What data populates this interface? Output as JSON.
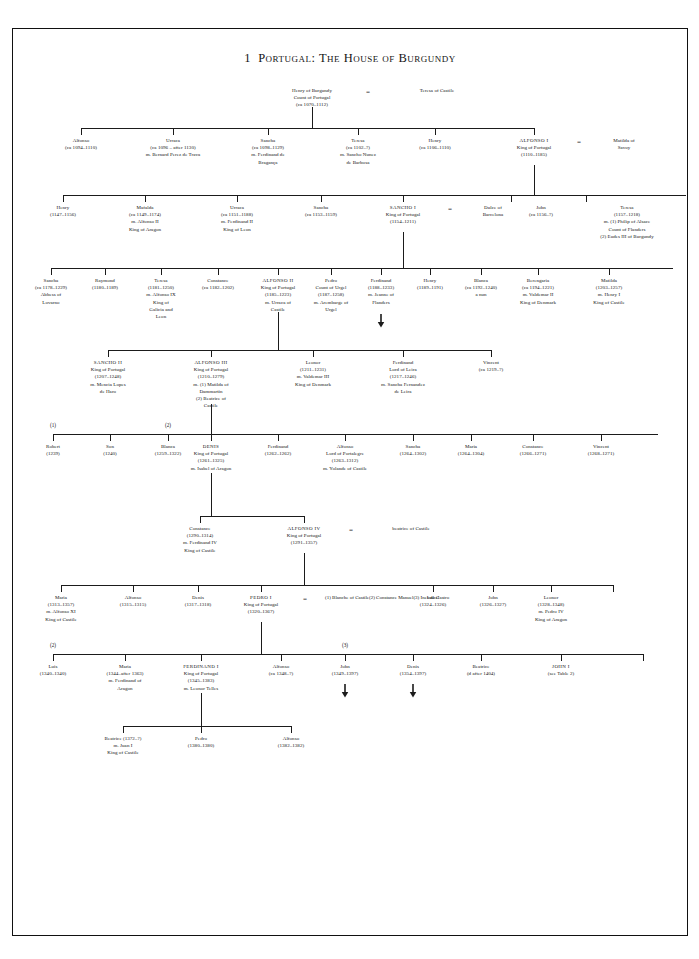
{
  "page": {
    "title_number": "1",
    "title_text": "Portugal: The House of Burgundy",
    "chart_type": "genealogical-tree"
  },
  "chart_data": {
    "type": "diagram",
    "notation": {
      "marriage_symbol": "=",
      "marriage_abbrev": "m.",
      "circa_abbrev": "ca",
      "continues_below_symbol": "down-arrow",
      "spouse_order_markers": [
        "(1)",
        "(2)",
        "(3)"
      ]
    },
    "generations": [
      {
        "index": 0,
        "people": [
          {
            "name": "Henry of Burgundy",
            "lines": [
              "Count of Portugal",
              "(ca 1070–1112)"
            ]
          },
          {
            "name": "Teresa of Castile",
            "lines": [],
            "role": "spouse"
          }
        ]
      },
      {
        "index": 1,
        "people": [
          {
            "name": "Alfonso",
            "lines": [
              "(ca 1094–1110)"
            ]
          },
          {
            "name": "Urraca",
            "lines": [
              "(ca 1096 – after 1130)",
              "m. Bernard Perez de Trava"
            ]
          },
          {
            "name": "Sancha",
            "lines": [
              "(ca 1098–1129)",
              "m. Ferdinand de",
              "Bragança"
            ]
          },
          {
            "name": "Teresa",
            "lines": [
              "(ca 1102–?)",
              "m. Sancho Nunez",
              "de Barbosa"
            ]
          },
          {
            "name": "Henry",
            "lines": [
              "(ca 1106–1110)"
            ]
          },
          {
            "name": "ALFONSO I",
            "king": true,
            "lines": [
              "King of Portugal",
              "(1110–1185)"
            ]
          },
          {
            "name": "Matilda of",
            "lines": [
              "Savoy"
            ],
            "role": "spouse"
          }
        ]
      },
      {
        "index": 2,
        "people": [
          {
            "name": "Henry",
            "lines": [
              "(1147–1156)"
            ]
          },
          {
            "name": "Mafalda",
            "lines": [
              "(ca 1149–1174)",
              "m. Alfonso II",
              "King of Aragon"
            ]
          },
          {
            "name": "Urraca",
            "lines": [
              "(ca 1151–1188)",
              "m. Ferdinand II",
              "King of Leon"
            ]
          },
          {
            "name": "Sancha",
            "lines": [
              "(ca 1153–1159)"
            ]
          },
          {
            "name": "SANCHO I",
            "king": true,
            "lines": [
              "King of Portugal",
              "(1154–1211)"
            ]
          },
          {
            "name": "Dulce of",
            "lines": [
              "Barcelona"
            ],
            "role": "spouse"
          },
          {
            "name": "John",
            "lines": [
              "(ca 1156–?)"
            ]
          },
          {
            "name": "Teresa",
            "lines": [
              "(1157–1218)",
              "m. (1) Philip of Alsace",
              "Count of Flanders",
              "(2) Eudes III of Burgundy"
            ]
          }
        ]
      },
      {
        "index": 3,
        "people": [
          {
            "name": "Sancha",
            "lines": [
              "(ca 1178–1229)",
              "Abbess of",
              "Lovarno"
            ]
          },
          {
            "name": "Raymond",
            "lines": [
              "(1180–1189)"
            ]
          },
          {
            "name": "Teresa",
            "lines": [
              "(1181–1250)",
              "m. Alfonso IX",
              "King of",
              "Galicia and",
              "Leon"
            ]
          },
          {
            "name": "Constance",
            "lines": [
              "(ca 1182–1202)"
            ]
          },
          {
            "name": "ALFONSO II",
            "king": true,
            "lines": [
              "King of Portugal",
              "(1185–1223)",
              "m. Urraca of",
              "Castile"
            ]
          },
          {
            "name": "Pedro",
            "lines": [
              "Count of Urgel",
              "(1187–1258)",
              "m. Arembarge of",
              "Urgel"
            ]
          },
          {
            "name": "Ferdinand",
            "lines": [
              "(1188–1233)",
              "m. Jeanne of",
              "Flanders"
            ],
            "arrow": true
          },
          {
            "name": "Henry",
            "lines": [
              "(1189–1191)"
            ]
          },
          {
            "name": "Blanca",
            "lines": [
              "(ca 1192–1240)",
              "a nun"
            ]
          },
          {
            "name": "Berengaria",
            "lines": [
              "(ca 1194–1221)",
              "m. Valdemar II",
              "King of Denmark"
            ]
          },
          {
            "name": "Matilda",
            "lines": [
              "(1203–1257)",
              "m. Henry I",
              "King of Castile"
            ]
          }
        ]
      },
      {
        "index": 4,
        "people": [
          {
            "name": "SANCHO II",
            "king": true,
            "lines": [
              "King of Portugal",
              "(1207–1248)",
              "m. Mencia Lopes",
              "de Haro"
            ]
          },
          {
            "name": "ALFONSO III",
            "king": true,
            "lines": [
              "King of Portugal",
              "(1210–1279)",
              "m. (1) Matilda of",
              "Dammartin",
              "(2) Beatrice of",
              "Castile"
            ]
          },
          {
            "name": "Leonor",
            "lines": [
              "(1211–1231)",
              "m. Valdemar III",
              "King of Denmark"
            ]
          },
          {
            "name": "Ferdinand",
            "lines": [
              "Lord of Leira",
              "(1217–1246)",
              "m. Sancha Fernandez",
              "de Leira"
            ]
          },
          {
            "name": "Vincent",
            "lines": [
              "(ca 1219–?)"
            ]
          }
        ]
      },
      {
        "index": 5,
        "marker_labels": [
          "(1)",
          "(2)"
        ],
        "people": [
          {
            "name": "Robert",
            "lines": [
              "(1239)"
            ],
            "marker": "(1)"
          },
          {
            "name": "Son",
            "lines": [
              "(1240)"
            ]
          },
          {
            "name": "Blanca",
            "lines": [
              "(1259–1322)"
            ],
            "marker": "(2)"
          },
          {
            "name": "DENIS",
            "king": true,
            "lines": [
              "King of Portugal",
              "(1261–1325)",
              "m. Isabel of Aragon"
            ]
          },
          {
            "name": "Ferdinand",
            "lines": [
              "(1262–1262)"
            ]
          },
          {
            "name": "Alfonso",
            "lines": [
              "Lord of Portalegre",
              "(1263–1312)",
              "m. Yolande of Castile"
            ]
          },
          {
            "name": "Sancha",
            "lines": [
              "(1264–1302)"
            ]
          },
          {
            "name": "Maria",
            "lines": [
              "(1264–1304)"
            ]
          },
          {
            "name": "Constance",
            "lines": [
              "(1266–1271)"
            ]
          },
          {
            "name": "Vincent",
            "lines": [
              "(1268–1271)"
            ]
          }
        ]
      },
      {
        "index": 6,
        "people": [
          {
            "name": "Constance",
            "lines": [
              "(1290–1314)",
              "m. Ferdinand IV",
              "King of Castile"
            ]
          },
          {
            "name": "ALFONSO IV",
            "king": true,
            "lines": [
              "King of Portugal",
              "(1291–1357)"
            ]
          },
          {
            "name": "beatrice of Castile",
            "lines": [],
            "role": "spouse"
          }
        ]
      },
      {
        "index": 7,
        "people": [
          {
            "name": "Maria",
            "lines": [
              "(1313–1357)",
              "m. Alfonso XI",
              "King of Castile"
            ]
          },
          {
            "name": "Alfonso",
            "lines": [
              "(1315–1315)"
            ]
          },
          {
            "name": "Denis",
            "lines": [
              "(1317–1318)"
            ]
          },
          {
            "name": "PEDRO I",
            "king": true,
            "lines": [
              "King of Portugal",
              "(1320–1367)"
            ]
          },
          {
            "name": "spouses",
            "role": "spouse",
            "lines": [
              "(1) Blanche of Castile",
              "(2) Constance Manuel",
              "(3) Ines de Castro"
            ]
          },
          {
            "name": "Isabel",
            "lines": [
              "(1324–1326)"
            ]
          },
          {
            "name": "John",
            "lines": [
              "(1326–1327)"
            ]
          },
          {
            "name": "Leonor",
            "lines": [
              "(1328–1348)",
              "m. Pedro IV",
              "King of Aragon"
            ]
          }
        ]
      },
      {
        "index": 8,
        "marker_labels": [
          "(2)",
          "(3)"
        ],
        "people": [
          {
            "name": "Luis",
            "lines": [
              "(1340–1340)"
            ],
            "marker": "(2)"
          },
          {
            "name": "Maria",
            "lines": [
              "(1344–after 1363)",
              "m. Ferdinand of",
              "Aragon"
            ]
          },
          {
            "name": "FERDINAND I",
            "king": true,
            "lines": [
              "King of Portugal",
              "(1345–1383)",
              "m. Leonor Telles"
            ]
          },
          {
            "name": "Alfonso",
            "lines": [
              "(ca 1348–?)"
            ]
          },
          {
            "name": "John",
            "lines": [
              "(1349–1397)"
            ],
            "arrow": true,
            "marker": "(3)"
          },
          {
            "name": "Denis",
            "lines": [
              "(1354–1397)"
            ],
            "arrow": true
          },
          {
            "name": "Beatrice",
            "lines": [
              "(d after 1404)"
            ]
          },
          {
            "name": "JOHN I",
            "king": true,
            "lines": [
              "(see Table 2)"
            ]
          }
        ]
      },
      {
        "index": 9,
        "people": [
          {
            "name": "Beatrice (1372–?)",
            "lines": [
              "m. Juan I",
              "King of Castile"
            ],
            "inline_name": true
          },
          {
            "name": "Pedro",
            "lines": [
              "(1380–1380)"
            ]
          },
          {
            "name": "Alfonso",
            "lines": [
              "(1382–1382)"
            ]
          }
        ]
      }
    ]
  }
}
